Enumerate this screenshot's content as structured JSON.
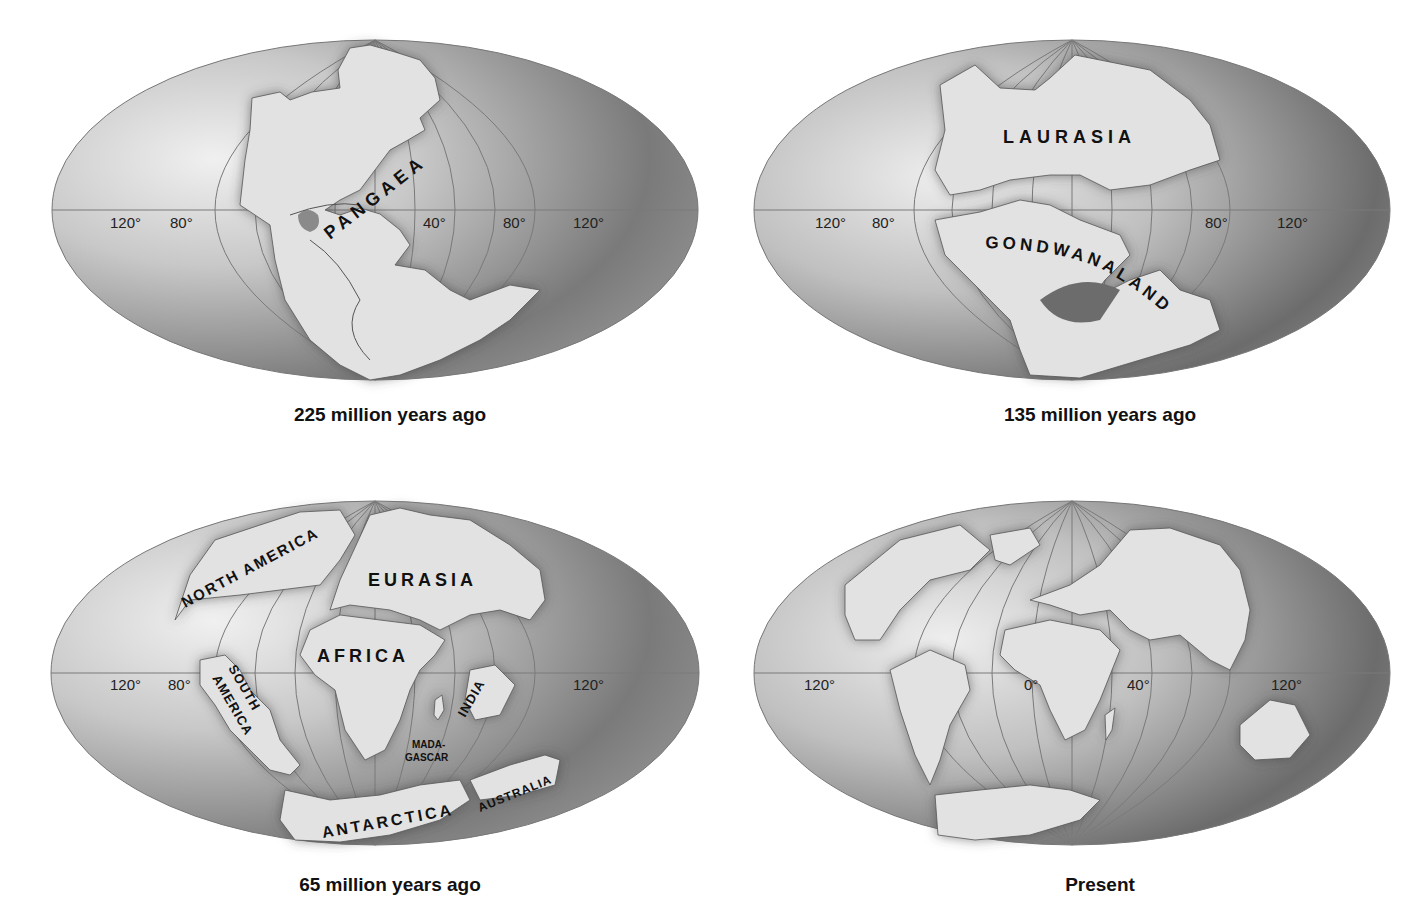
{
  "figure": {
    "panels": [
      {
        "id": "p225",
        "caption": "225 million years ago",
        "labels": [
          {
            "text": "PANGAEA"
          }
        ],
        "longitude_labels": [
          "120°",
          "80°",
          "40°",
          "80°",
          "120°"
        ]
      },
      {
        "id": "p135",
        "caption": "135 million years ago",
        "labels": [
          {
            "text": "LAURASIA"
          },
          {
            "text": "GONDWANALAND"
          }
        ],
        "longitude_labels": [
          "120°",
          "80°",
          "80°",
          "120°"
        ]
      },
      {
        "id": "p65",
        "caption": "65 million years ago",
        "labels": [
          {
            "text": "NORTH AMERICA"
          },
          {
            "text": "EURASIA"
          },
          {
            "text": "AFRICA"
          },
          {
            "text": "SOUTH"
          },
          {
            "text": "AMERICA"
          },
          {
            "text": "INDIA"
          },
          {
            "text": "MADA-"
          },
          {
            "text": "GASCAR"
          },
          {
            "text": "ANTARCTICA"
          },
          {
            "text": "AUSTRALIA"
          }
        ],
        "longitude_labels": [
          "120°",
          "80°",
          "120°"
        ]
      },
      {
        "id": "present",
        "caption": "Present",
        "labels": [],
        "longitude_labels": [
          "120°",
          "0°",
          "40°",
          "120°"
        ]
      }
    ],
    "colors": {
      "ocean_light": "#d8d8d8",
      "ocean_dark": "#6a6a6a",
      "land": "#e2e2e2",
      "grid": "#7a7a7a",
      "text": "#111111"
    }
  }
}
